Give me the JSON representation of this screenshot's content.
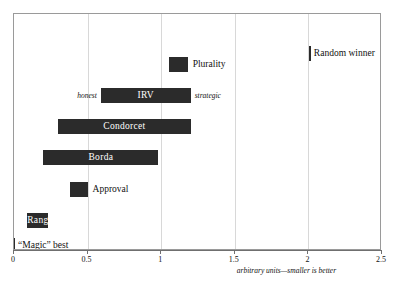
{
  "chart_data": {
    "type": "bar",
    "orientation": "horizontal",
    "bar_style": "range",
    "title": "",
    "xlabel": "arbitrary units—smaller is better",
    "ylabel": "",
    "xlim": [
      0,
      2.5
    ],
    "grid": true,
    "gridlines": [
      0.5,
      1,
      1.5,
      2
    ],
    "xticks": [
      0,
      0.5,
      1,
      1.5,
      2,
      2.5
    ],
    "xticklabels": [
      "0",
      "0.5",
      "1",
      "1.5",
      "2",
      "2.5"
    ],
    "legend": "none",
    "bar_color": "#2b2b2b",
    "categories": [
      "Random winner",
      "Plurality",
      "IRV",
      "Condorcet",
      "Borda",
      "Approval",
      "Range",
      "“Magic” best"
    ],
    "items": [
      {
        "label": "Random winner",
        "start": 2.01,
        "end": 2.01,
        "marker": true,
        "label_position": "right",
        "left_note": "",
        "right_note": ""
      },
      {
        "label": "Plurality",
        "start": 1.05,
        "end": 1.18,
        "marker": false,
        "label_position": "right",
        "left_note": "",
        "right_note": ""
      },
      {
        "label": "IRV",
        "start": 0.59,
        "end": 1.2,
        "marker": false,
        "label_position": "inside",
        "left_note": "honest",
        "right_note": "strategic"
      },
      {
        "label": "Condorcet",
        "start": 0.3,
        "end": 1.2,
        "marker": false,
        "label_position": "inside",
        "left_note": "",
        "right_note": ""
      },
      {
        "label": "Borda",
        "start": 0.2,
        "end": 0.98,
        "marker": false,
        "label_position": "inside",
        "left_note": "",
        "right_note": ""
      },
      {
        "label": "Approval",
        "start": 0.38,
        "end": 0.5,
        "marker": false,
        "label_position": "right",
        "left_note": "",
        "right_note": ""
      },
      {
        "label": "Range",
        "start": 0.09,
        "end": 0.23,
        "marker": false,
        "label_position": "inside",
        "left_note": "",
        "right_note": ""
      },
      {
        "label": "“Magic” best",
        "start": 0.0,
        "end": 0.0,
        "marker": true,
        "label_position": "right",
        "left_note": "",
        "right_note": ""
      }
    ]
  },
  "axis": {
    "caption": "arbitrary units—smaller is better",
    "tick_labels": [
      "0",
      "0.5",
      "1",
      "1.5",
      "2",
      "2.5"
    ]
  },
  "labels": {
    "random_winner": "Random winner",
    "plurality": "Plurality",
    "irv": "IRV",
    "irv_honest": "honest",
    "irv_strategic": "strategic",
    "condorcet": "Condorcet",
    "borda": "Borda",
    "approval": "Approval",
    "range": "Range",
    "magic_best": "“Magic” best"
  },
  "colors": {
    "bar": "#2b2b2b",
    "grid": "#d8d8d8",
    "frame": "#9a9a9a",
    "axis": "#6f6f6f",
    "background": "#ffffff"
  }
}
